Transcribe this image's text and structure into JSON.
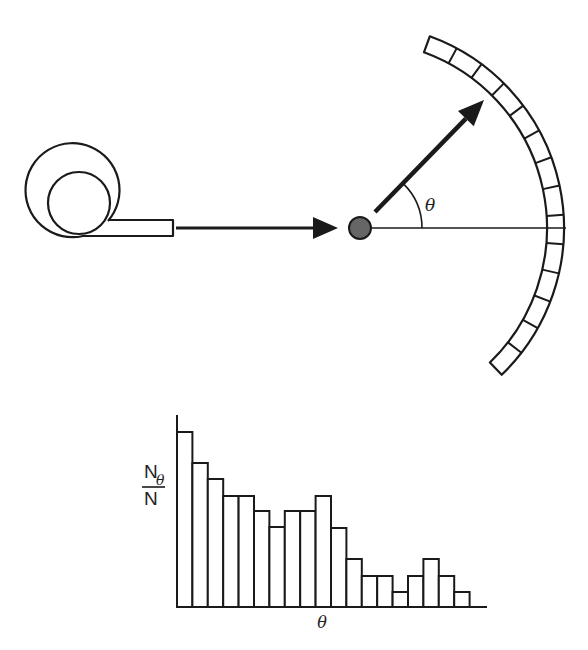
{
  "diagram": {
    "source": {
      "label": "beam-source",
      "outer": {
        "cx": 79,
        "cy": 204,
        "r": 47
      },
      "inner": {
        "cx": 79,
        "cy": 203,
        "r": 31
      }
    },
    "incident_arrow": {
      "x1": 176,
      "y": 228,
      "x2": 338
    },
    "target": {
      "cx": 360,
      "cy": 228,
      "r": 11,
      "color": "#555555"
    },
    "scattered_arrow": {
      "x1": 375,
      "y1": 212,
      "x2": 484,
      "y2": 100
    },
    "angle_label": "θ",
    "detector": {
      "cx": 360,
      "cy": 228,
      "r_inner": 187,
      "r_outer": 204,
      "start_deg": -70,
      "end_deg": 46,
      "segments": 14
    },
    "reference_line": {
      "x1": 372,
      "x2": 566,
      "y": 228
    }
  },
  "chart_data": {
    "type": "bar",
    "title": "",
    "xlabel": "θ",
    "ylabel": "Nθ / N",
    "ylabel_num": "N",
    "ylabel_sub": "θ",
    "ylabel_den": "N",
    "categories": [
      "1",
      "2",
      "3",
      "4",
      "5",
      "6",
      "7",
      "8",
      "9",
      "10",
      "11",
      "12",
      "13",
      "14",
      "15",
      "16",
      "17",
      "18",
      "19"
    ],
    "values": [
      175,
      144,
      128,
      111,
      111,
      96,
      80,
      96,
      96,
      111,
      79,
      48,
      31,
      31,
      15,
      31,
      48,
      31,
      15
    ],
    "value_units": "relative (pixels above baseline)",
    "ylim": [
      0,
      192
    ],
    "grid": false,
    "legend": null,
    "plot": {
      "x0": 177,
      "baseline": 607,
      "bar_width": 15.4,
      "y_axis_top": 415,
      "x_axis_right": 487
    }
  },
  "colors": {
    "ink": "#1a1a1a",
    "background": "#ffffff",
    "target_fill": "#666666"
  }
}
